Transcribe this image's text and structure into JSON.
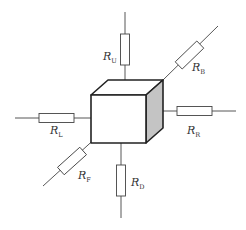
{
  "diagram": {
    "colors": {
      "background": "#ffffff",
      "line": "#444444",
      "cube_edge": "#222222",
      "shaded_face": "#c4c4c4"
    },
    "resistors": [
      {
        "id": "U",
        "label": "R",
        "subscript": "U",
        "direction": "up"
      },
      {
        "id": "B",
        "label": "R",
        "subscript": "B",
        "direction": "back"
      },
      {
        "id": "R",
        "label": "R",
        "subscript": "R",
        "direction": "right"
      },
      {
        "id": "L",
        "label": "R",
        "subscript": "L",
        "direction": "left"
      },
      {
        "id": "F",
        "label": "R",
        "subscript": "F",
        "direction": "front"
      },
      {
        "id": "D",
        "label": "R",
        "subscript": "D",
        "direction": "down"
      }
    ]
  }
}
